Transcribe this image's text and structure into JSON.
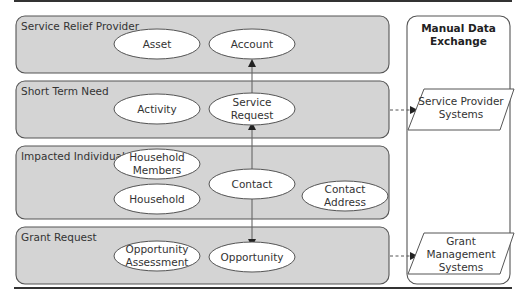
{
  "diagram": {
    "lanes": [
      {
        "label": "Service Relief Provider"
      },
      {
        "label": "Short Term Need"
      },
      {
        "label": "Impacted Individuals"
      },
      {
        "label": "Grant Request"
      }
    ],
    "nodes": {
      "asset": {
        "line1": "Asset"
      },
      "account": {
        "line1": "Account"
      },
      "activity": {
        "line1": "Activity"
      },
      "service_request": {
        "line1": "Service",
        "line2": "Request"
      },
      "household_members": {
        "line1": "Household",
        "line2": "Members"
      },
      "household": {
        "line1": "Household"
      },
      "contact": {
        "line1": "Contact"
      },
      "contact_address": {
        "line1": "Contact",
        "line2": "Address"
      },
      "opportunity_assessment": {
        "line1": "Opportunity",
        "line2": "Assessment"
      },
      "opportunity": {
        "line1": "Opportunity"
      }
    },
    "panel": {
      "title_line1": "Manual Data",
      "title_line2": "Exchange",
      "systems": [
        {
          "line1": "Service Provider",
          "line2": "Systems"
        },
        {
          "line1": "Grant",
          "line2": "Management",
          "line3": "Systems"
        }
      ]
    },
    "connections": [
      {
        "from": "Service Request",
        "to": "Account",
        "style": "solid-arrow"
      },
      {
        "from": "Contact",
        "to": "Service Request",
        "style": "solid-arrow"
      },
      {
        "from": "Contact",
        "to": "Opportunity",
        "style": "solid-arrow"
      },
      {
        "from": "Short Term Need",
        "to": "Service Provider Systems",
        "style": "dashed-arrow"
      },
      {
        "from": "Grant Request",
        "to": "Grant Management Systems",
        "style": "dashed-arrow"
      }
    ],
    "colors": {
      "lane_fill": "#d4d4d4",
      "stroke": "#555555",
      "node_fill": "#ffffff",
      "text": "#333333"
    }
  }
}
